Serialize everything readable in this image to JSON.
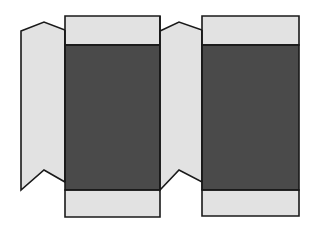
{
  "document": {
    "title": "Carton Dieline Template",
    "type": "packaging-net",
    "canvas": {
      "width": 315,
      "height": 235,
      "background": "#ffffff"
    }
  },
  "palette": {
    "background": "#ffffff",
    "light_panel": "#e2e2e2",
    "light_panel_alt": "#dedede",
    "dark_panel": "#4a4a4a",
    "outline": "#1a1a1a"
  },
  "shapes": {
    "left_glue_flap": {
      "name": "Left glue flap",
      "fill": "#e2e2e2",
      "points": "21,31 44,22 65,30 65,182 44,170 21,190"
    },
    "left_panel_top_flap": {
      "name": "Left panel top flap",
      "fill": "#e2e2e2",
      "points": "65,16 160,16 160,45 65,45"
    },
    "left_panel_body": {
      "name": "Left panel body",
      "fill": "#4a4a4a",
      "points": "65,45 160,45 160,190 65,190"
    },
    "left_panel_bottom_flap": {
      "name": "Left panel bottom flap",
      "fill": "#e2e2e2",
      "points": "65,190 160,190 160,217 65,217"
    },
    "center_glue_flap": {
      "name": "Center glue flap",
      "fill": "#e2e2e2",
      "points": "160,31 179,22 202,30 202,182 179,170 160,190"
    },
    "right_panel_top_flap": {
      "name": "Right panel top flap",
      "fill": "#e2e2e2",
      "points": "202,16 299,16 299,45 202,45"
    },
    "right_panel_body": {
      "name": "Right panel body",
      "fill": "#4a4a4a",
      "points": "202,45 299,45 299,190 202,190"
    },
    "right_panel_bottom_flap": {
      "name": "Right panel bottom flap",
      "fill": "#e2e2e2",
      "points": "202,190 299,190 299,216 202,216"
    }
  },
  "fold_lines": [
    {
      "name": "left-flap-to-panel-fold",
      "d": "M65,30 L65,182"
    },
    {
      "name": "left-panel-top-fold",
      "d": "M65,45 L160,45"
    },
    {
      "name": "left-panel-bottom-fold",
      "d": "M65,190 L160,190"
    },
    {
      "name": "left-panel-to-center-flap-fold",
      "d": "M160,16 L160,190"
    },
    {
      "name": "center-flap-to-right-panel-fold",
      "d": "M202,30 L202,190"
    },
    {
      "name": "right-panel-top-fold",
      "d": "M202,45 L299,45"
    },
    {
      "name": "right-panel-bottom-fold",
      "d": "M202,190 L299,190"
    }
  ]
}
